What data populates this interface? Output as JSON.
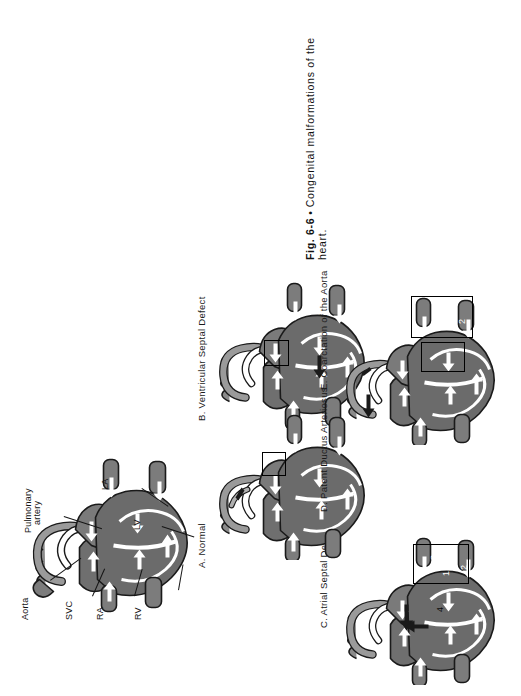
{
  "figure": {
    "caption": {
      "figure_number": "Fig. 6-6",
      "bullet": "•",
      "line1_text": "Congenital   malformations   of   the",
      "line2_text": "heart.",
      "full_text": "Fig. 6-6 • Congenital malformations of the heart."
    },
    "orientation": "rotated-90-ccw",
    "panels": [
      {
        "id": "A",
        "label": "A. Normal",
        "letter": "A",
        "title": "Normal"
      },
      {
        "id": "B",
        "label": "B. Ventricular Septal Defect",
        "letter": "B",
        "title": "Ventricular Septal Defect"
      },
      {
        "id": "C",
        "label": "C. Atrial Septal Defect",
        "letter": "C",
        "title": "Atrial Septal Defect"
      },
      {
        "id": "D",
        "label": "D. Patent Ductus Arteriosus",
        "letter": "D",
        "title": "Patent Ductus Arteriosus"
      },
      {
        "id": "E",
        "label": "E. Coarctation of the Aorta",
        "letter": "E",
        "title": "Coarctation of the Aorta"
      }
    ],
    "anatomy_labels": [
      {
        "id": "aorta",
        "text": "Aorta"
      },
      {
        "id": "pulmonary-artery",
        "text_line1": "Pulmonary",
        "text_line2": "artery",
        "text": "Pulmonary artery"
      },
      {
        "id": "svc",
        "text": "SVC"
      },
      {
        "id": "ra",
        "text": "RA"
      },
      {
        "id": "rv",
        "text": "RV"
      },
      {
        "id": "la",
        "text": "LA"
      },
      {
        "id": "lv",
        "text": "LV"
      }
    ],
    "callout_numbers": {
      "panel_c": [
        "1",
        "2",
        "3",
        "4"
      ],
      "panel_e": [
        "1",
        "2"
      ]
    },
    "colors": {
      "ink": "#111111",
      "muscle_dark": "#6b6b6b",
      "muscle_mid": "#8a8a8a",
      "muscle_light": "#a8a8a8",
      "vessel_gray": "#7c7c7c",
      "outline": "#1a1a1a",
      "flow_arrow": "#ffffff",
      "background": "#ffffff"
    }
  }
}
